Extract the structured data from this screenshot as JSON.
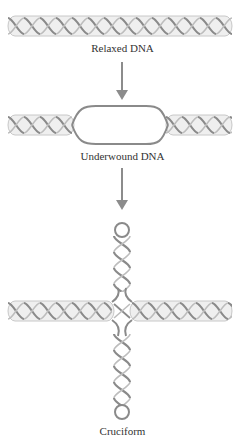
{
  "figure": {
    "stages": [
      {
        "id": "relaxed",
        "label": "Relaxed DNA"
      },
      {
        "id": "underwound",
        "label": "Underwound DNA"
      },
      {
        "id": "cruciform",
        "label": "Cruciform"
      }
    ],
    "colors": {
      "strand": "#8a8a8a",
      "strand_light": "#bdbdbd",
      "tube": "#e6e6e6",
      "arrow": "#8c8c8c",
      "text": "#333333"
    }
  }
}
